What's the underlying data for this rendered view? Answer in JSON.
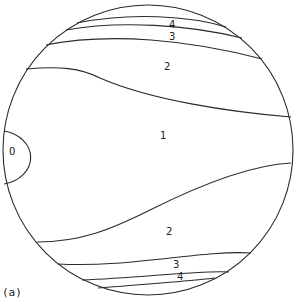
{
  "figure": {
    "caption": "(a)",
    "stroke_color": "#2a2a2a",
    "background": "#ffffff"
  },
  "regions": [
    {
      "id": "region-0",
      "label": "0"
    },
    {
      "id": "region-1",
      "label": "1"
    },
    {
      "id": "region-2-top",
      "label": "2"
    },
    {
      "id": "region-3-top",
      "label": "3"
    },
    {
      "id": "region-4-top",
      "label": "4"
    },
    {
      "id": "region-2-bottom",
      "label": "2"
    },
    {
      "id": "region-3-bottom",
      "label": "3"
    },
    {
      "id": "region-4-bottom",
      "label": "4"
    }
  ]
}
